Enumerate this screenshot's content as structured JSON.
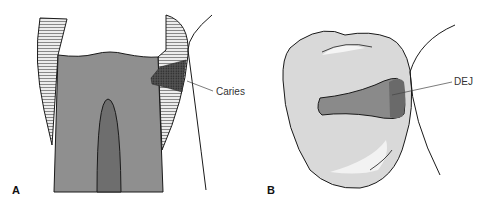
{
  "figure": {
    "panels": [
      {
        "id": "A",
        "label": "A",
        "annotation": "Caries"
      },
      {
        "id": "B",
        "label": "B",
        "annotation": "DEJ"
      }
    ],
    "colors": {
      "dentin": "#8f8f8f",
      "pulp": "#6e6e6e",
      "enamel": "#e4e4e4",
      "crown_b": "#d9d9d9",
      "lesion_b": "#8a8a8a",
      "lesion_b_dark": "#6a6a6a",
      "caries": "#3a3a3a",
      "outline": "#1a1a1a"
    }
  }
}
